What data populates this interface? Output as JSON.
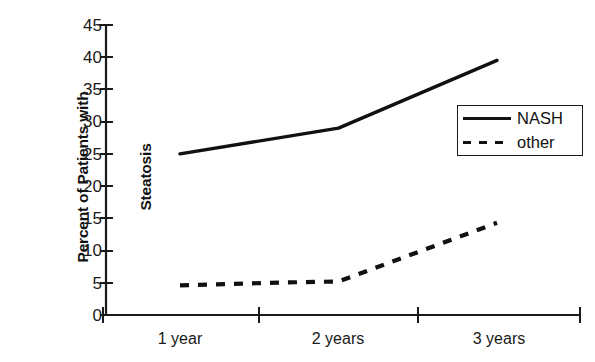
{
  "chart_data": {
    "type": "line",
    "title": "",
    "xlabel": "",
    "ylabel": "Percent of Patients with Steatosis",
    "ylabel_lines": [
      "Percent of Patients with",
      "Steatosis"
    ],
    "categories": [
      "1 year",
      "2 years",
      "3 years"
    ],
    "xtick_labels": [
      "1 year",
      "2 years",
      "3 years"
    ],
    "ytick_labels": [
      "0",
      "5",
      "10",
      "15",
      "20",
      "25",
      "30",
      "35",
      "40",
      "45"
    ],
    "ytick_values": [
      0,
      5,
      10,
      15,
      20,
      25,
      30,
      35,
      40,
      45
    ],
    "ylim": [
      0,
      45
    ],
    "grid": false,
    "legend_position": "right-upper",
    "series": [
      {
        "name": "NASH",
        "style": "solid",
        "color": "#111111",
        "x": [
          "1 year",
          "2 years",
          "3 years"
        ],
        "values": [
          25.0,
          29.8,
          39.5
        ]
      },
      {
        "name": "other",
        "style": "dashed",
        "color": "#111111",
        "x": [
          "1 year",
          "2 years",
          "3 years"
        ],
        "values": [
          5.0,
          5.7,
          14.3
        ]
      }
    ],
    "series_detail_points": {
      "NASH": [
        {
          "x_frac": 0.0,
          "value": 25.0
        },
        {
          "x_frac": 0.5,
          "value": 29.0
        },
        {
          "x_frac": 1.0,
          "value": 39.5
        }
      ],
      "other": [
        {
          "x_frac": 0.0,
          "value": 4.6
        },
        {
          "x_frac": 0.28,
          "value": 5.0
        },
        {
          "x_frac": 0.5,
          "value": 5.2
        },
        {
          "x_frac": 1.0,
          "value": 14.3
        }
      ]
    }
  },
  "legend": {
    "entries": [
      {
        "label": "NASH",
        "style": "solid"
      },
      {
        "label": "other",
        "style": "dashed"
      }
    ]
  },
  "axes": {
    "y_title_line1": "Percent of Patients with",
    "y_title_line2": "Steatosis"
  }
}
